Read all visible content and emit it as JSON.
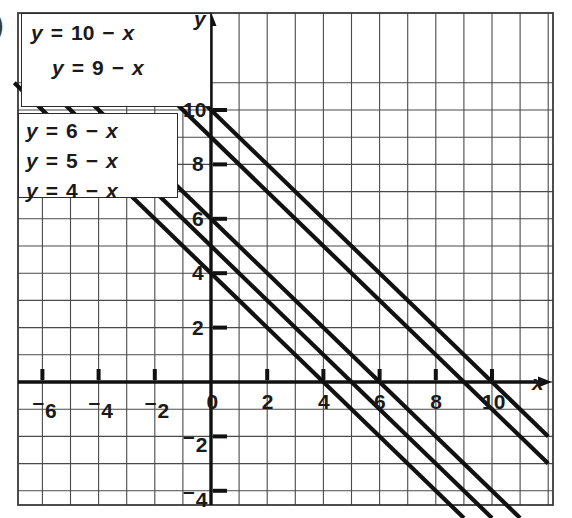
{
  "figure": {
    "type": "coordinate-graph",
    "stray_mark": ")",
    "axis_labels": {
      "x": "x",
      "y": "y"
    }
  },
  "chart_data": {
    "type": "line",
    "title": "",
    "xlabel": "x",
    "ylabel": "y",
    "xlim": [
      -7,
      12
    ],
    "ylim": [
      -5,
      11
    ],
    "grid": true,
    "legend_position": "upper-left-boxes",
    "series": [
      {
        "name": "y = 10 − x",
        "slope": -1,
        "intercept": 10,
        "label_parts": {
          "lhs": "y",
          "eq": "=",
          "c": "10",
          "minus": "−",
          "x": "x"
        }
      },
      {
        "name": "y = 9 − x",
        "slope": -1,
        "intercept": 9,
        "label_parts": {
          "lhs": "y",
          "eq": "=",
          "c": "9",
          "minus": "−",
          "x": "x"
        }
      },
      {
        "name": "y = 6 − x",
        "slope": -1,
        "intercept": 6,
        "label_parts": {
          "lhs": "y",
          "eq": "=",
          "c": "6",
          "minus": "−",
          "x": "x"
        }
      },
      {
        "name": "y = 5 − x",
        "slope": -1,
        "intercept": 5,
        "label_parts": {
          "lhs": "y",
          "eq": "=",
          "c": "5",
          "minus": "−",
          "x": "x"
        }
      },
      {
        "name": "y = 4 − x",
        "slope": -1,
        "intercept": 4,
        "label_parts": {
          "lhs": "y",
          "eq": "=",
          "c": "4",
          "minus": "−",
          "x": "x"
        }
      }
    ],
    "x_ticks": [
      {
        "value": -6,
        "label": "6",
        "negative": true
      },
      {
        "value": -4,
        "label": "4",
        "negative": true
      },
      {
        "value": -2,
        "label": "2",
        "negative": true
      },
      {
        "value": 0,
        "label": "0",
        "negative": false
      },
      {
        "value": 2,
        "label": "2",
        "negative": false
      },
      {
        "value": 4,
        "label": "4",
        "negative": false
      },
      {
        "value": 6,
        "label": "6",
        "negative": false
      },
      {
        "value": 8,
        "label": "8",
        "negative": false
      },
      {
        "value": 10,
        "label": "10",
        "negative": false
      }
    ],
    "y_ticks": [
      {
        "value": 10,
        "label": "10",
        "negative": false
      },
      {
        "value": 8,
        "label": "8",
        "negative": false
      },
      {
        "value": 6,
        "label": "6",
        "negative": false
      },
      {
        "value": 4,
        "label": "4",
        "negative": false
      },
      {
        "value": 2,
        "label": "2",
        "negative": false
      },
      {
        "value": -2,
        "label": "2",
        "negative": true
      },
      {
        "value": -4,
        "label": "4",
        "negative": true
      }
    ]
  },
  "equation_boxes": [
    {
      "id": "box-upper",
      "lines": [
        "y = 10 − x",
        "y = 9 − x"
      ]
    },
    {
      "id": "box-lower",
      "lines": [
        "y = 6 − x",
        "y = 5 − x",
        "y = 4 − x"
      ]
    }
  ]
}
